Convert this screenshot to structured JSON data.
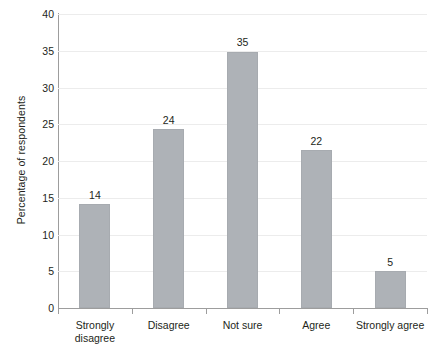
{
  "chart_data": {
    "type": "bar",
    "title": "",
    "subtitle": "",
    "xlabel": "",
    "ylabel": "Percentage of respondents",
    "categories": [
      "Strongly disagree",
      "Disagree",
      "Not sure",
      "Agree",
      "Strongly agree"
    ],
    "category_lines": [
      [
        "Strongly",
        "disagree"
      ],
      [
        "Disagree"
      ],
      [
        "Not sure"
      ],
      [
        "Agree"
      ],
      [
        "Strongly agree"
      ]
    ],
    "values": [
      14,
      24,
      35,
      22,
      5
    ],
    "bar_heights": [
      14.2,
      24.3,
      34.9,
      21.5,
      5.0
    ],
    "data_labels": [
      "14",
      "24",
      "35",
      "22",
      "5"
    ],
    "ylim": [
      0,
      40
    ],
    "yticks": [
      0,
      5,
      10,
      15,
      20,
      25,
      30,
      35,
      40
    ],
    "ytick_labels": [
      "0",
      "5",
      "10",
      "15",
      "20",
      "25",
      "30",
      "35",
      "40"
    ],
    "grid": true,
    "grid_axis": "y",
    "legend": false,
    "legend_position": "none",
    "colors": {
      "bar_fill": "#aeb2b7",
      "bar_stroke": "#a7abb0",
      "gridline": "#ececec",
      "axis_line": "#9d9d9d",
      "text": "#231f20",
      "background": "#ffffff"
    }
  }
}
